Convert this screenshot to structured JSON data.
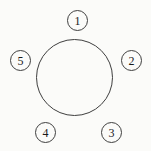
{
  "diagram": {
    "type": "circle-with-satellite-nodes",
    "main_circle": {
      "shape": "circle",
      "label": ""
    },
    "nodes": [
      {
        "id": "node-1",
        "label": "1",
        "position": "top"
      },
      {
        "id": "node-2",
        "label": "2",
        "position": "right"
      },
      {
        "id": "node-3",
        "label": "3",
        "position": "bottom-right"
      },
      {
        "id": "node-4",
        "label": "4",
        "position": "bottom-left"
      },
      {
        "id": "node-5",
        "label": "5",
        "position": "left"
      }
    ],
    "colors": {
      "stroke": "#3f3f3f",
      "text": "#1a1a1a",
      "background": "#fbfbf9"
    }
  }
}
